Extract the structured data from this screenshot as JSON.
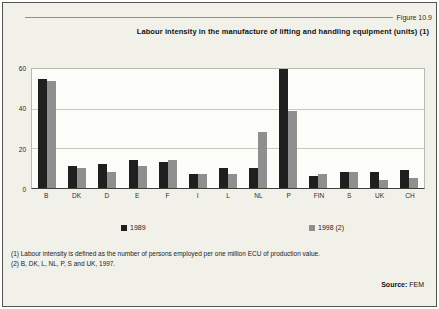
{
  "figure": {
    "label": "Figure 10.9",
    "title": "Labour intensity in the manufacture of lifting and handling equipment (units) (1)"
  },
  "chart_data": {
    "type": "bar",
    "categories": [
      "B",
      "DK",
      "D",
      "E",
      "F",
      "I",
      "L",
      "NL",
      "P",
      "FIN",
      "S",
      "UK",
      "CH"
    ],
    "series": [
      {
        "name": "1989",
        "color": "#1f1f1f",
        "values": [
          55,
          11,
          12,
          14,
          13,
          7,
          10,
          10,
          60,
          6,
          8,
          8,
          9
        ]
      },
      {
        "name": "1998 (2)",
        "color": "#8f8f8f",
        "values": [
          54,
          10,
          8,
          11,
          14,
          7,
          7,
          28,
          39,
          7,
          8,
          4,
          5
        ]
      }
    ],
    "ylim": [
      0,
      60
    ],
    "yticks": [
      0,
      20,
      40,
      60
    ],
    "grid": true,
    "legend_position": "bottom",
    "plot_background": "#fcfcf8",
    "gridline_color": "#c9c9c1"
  },
  "footnotes": {
    "line1": "(1) Labour intensity is defined as the number of persons employed per one million ECU of production value.",
    "line2": "(2) B, DK, L, NL, P, S and UK, 1997."
  },
  "source": {
    "label": "Source:",
    "value": "FEM"
  }
}
